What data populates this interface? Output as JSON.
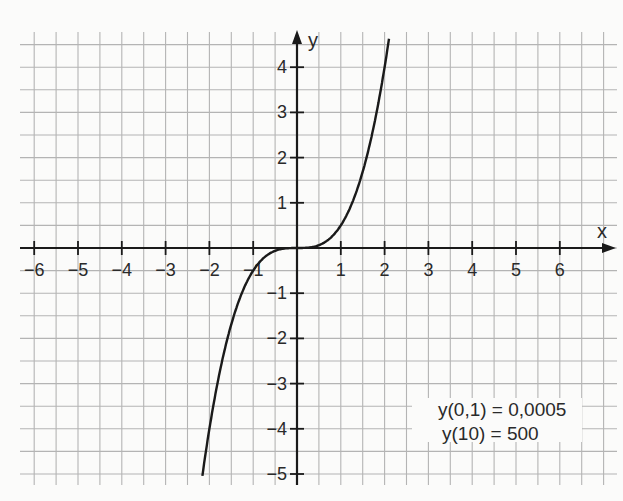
{
  "chart_data": {
    "type": "line",
    "title": "",
    "function": "y = 0.5 * x^3",
    "xlabel": "x",
    "ylabel": "y",
    "xlim": [
      -6.3,
      7.3
    ],
    "ylim": [
      -5.3,
      4.8
    ],
    "grid": true,
    "grid_step": 0.5,
    "x_ticks": [
      -6,
      -5,
      -4,
      -3,
      -2,
      -1,
      1,
      2,
      3,
      4,
      5,
      6
    ],
    "x_tick_labels": [
      "-6",
      "-5",
      "-4",
      "-3",
      "-2",
      "-1",
      "1",
      "2",
      "3",
      "4",
      "5",
      "6"
    ],
    "y_ticks": [
      4,
      3,
      2,
      1,
      -1,
      -2,
      -3,
      -4,
      -5
    ],
    "y_tick_labels": [
      "4",
      "3",
      "2",
      "1",
      "-1",
      "-2",
      "-3",
      "-4",
      "-5"
    ],
    "series": [
      {
        "name": "y = 0.5x³",
        "x": [
          -2.2,
          -2.0,
          -1.75,
          -1.5,
          -1.25,
          -1.0,
          -0.75,
          -0.5,
          -0.25,
          0,
          0.25,
          0.5,
          0.75,
          1.0,
          1.25,
          1.5,
          1.75,
          2.0,
          2.1
        ],
        "y": [
          -5.32,
          -4.0,
          -2.68,
          -1.69,
          -0.98,
          -0.5,
          -0.21,
          -0.06,
          -0.01,
          0,
          0.01,
          0.06,
          0.21,
          0.5,
          0.98,
          1.69,
          2.68,
          4.0,
          4.63
        ]
      }
    ],
    "annotations": [
      "y(0,1) = 0,0005",
      "y(10) = 500"
    ],
    "colors": {
      "curve": "#1a1a1a",
      "axis": "#1a1a1a",
      "grid": "#b4b4b4",
      "background": "#fbfbfa"
    }
  }
}
